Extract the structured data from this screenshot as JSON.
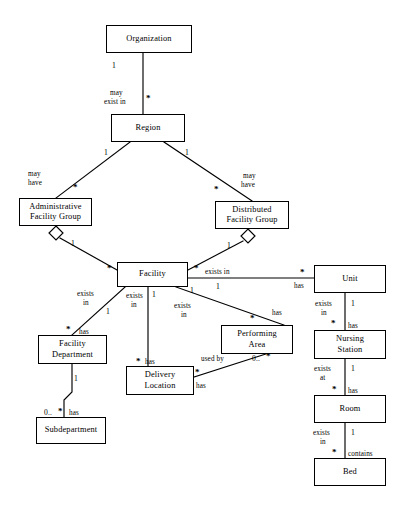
{
  "diagram": {
    "type": "uml-class-diagram",
    "background_color": "#ffffff",
    "line_color": "#000000"
  },
  "entities": [
    {
      "id": "organization",
      "name": "Organization",
      "lines": [
        "Organization"
      ],
      "x": 106,
      "y": 25,
      "w": 86,
      "h": 28
    },
    {
      "id": "region",
      "name": "Region",
      "lines": [
        "Region"
      ],
      "x": 111,
      "y": 114,
      "w": 74,
      "h": 28
    },
    {
      "id": "administrative_group",
      "name": "Administrative Facility Group",
      "lines": [
        "Administrative",
        "Facility Group"
      ],
      "x": 19,
      "y": 198,
      "w": 73,
      "h": 28
    },
    {
      "id": "distributed_group",
      "name": "Distributed Facility Group",
      "lines": [
        "Distributed",
        "Facility Group"
      ],
      "x": 215,
      "y": 201,
      "w": 74,
      "h": 28
    },
    {
      "id": "facility",
      "name": "Facility",
      "lines": [
        "Facility"
      ],
      "x": 117,
      "y": 262,
      "w": 71,
      "h": 25
    },
    {
      "id": "unit",
      "name": "Unit",
      "lines": [
        "Unit"
      ],
      "x": 314,
      "y": 265,
      "w": 72,
      "h": 28
    },
    {
      "id": "nursing_station",
      "name": "Nursing Station",
      "lines": [
        "Nursing",
        "Station"
      ],
      "x": 314,
      "y": 330,
      "w": 72,
      "h": 29
    },
    {
      "id": "room",
      "name": "Room",
      "lines": [
        "Room"
      ],
      "x": 314,
      "y": 395,
      "w": 72,
      "h": 28
    },
    {
      "id": "bed",
      "name": "Bed",
      "lines": [
        "Bed"
      ],
      "x": 314,
      "y": 458,
      "w": 72,
      "h": 28
    },
    {
      "id": "facility_department",
      "name": "Facility Department",
      "lines": [
        "Facility",
        "Department"
      ],
      "x": 38,
      "y": 335,
      "w": 69,
      "h": 29
    },
    {
      "id": "subdepartment",
      "name": "Subdepartment",
      "lines": [
        "Subdepartment"
      ],
      "x": 36,
      "y": 417,
      "w": 70,
      "h": 27
    },
    {
      "id": "delivery_location",
      "name": "Delivery Location",
      "lines": [
        "Delivery",
        "Location"
      ],
      "x": 126,
      "y": 366,
      "w": 68,
      "h": 29
    },
    {
      "id": "performing_area",
      "name": "Performing Area",
      "lines": [
        "Performing",
        "Area"
      ],
      "x": 221,
      "y": 325,
      "w": 72,
      "h": 29
    }
  ],
  "relationships": [
    {
      "id": "org-region",
      "from": "organization",
      "to": "region",
      "from_mult": "1",
      "to_mult": "*",
      "label": "may\nexist in",
      "kind": "association"
    },
    {
      "id": "region-admin",
      "from": "region",
      "to": "administrative_group",
      "from_mult": "1",
      "to_mult": "*",
      "label": "may\nhave",
      "kind": "association"
    },
    {
      "id": "region-distributed",
      "from": "region",
      "to": "distributed_group",
      "from_mult": "1",
      "to_mult": "*",
      "label": "may\nhave",
      "kind": "association"
    },
    {
      "id": "admin-facility",
      "from": "administrative_group",
      "to": "facility",
      "from_mult": "1",
      "to_mult": "*",
      "label": "",
      "kind": "aggregation"
    },
    {
      "id": "distributed-facility",
      "from": "distributed_group",
      "to": "facility",
      "from_mult": "1",
      "to_mult": "*",
      "label": "",
      "kind": "aggregation"
    },
    {
      "id": "facility-unit",
      "from": "facility",
      "to": "unit",
      "from_mult": "1",
      "to_mult": "*",
      "label": "exists in",
      "label2": "has",
      "kind": "association"
    },
    {
      "id": "facility-department",
      "from": "facility",
      "to": "facility_department",
      "from_mult": "1",
      "to_mult": "*",
      "label": "exists\nin",
      "label2": "has",
      "kind": "association"
    },
    {
      "id": "facility-delivery",
      "from": "facility",
      "to": "delivery_location",
      "from_mult": "1",
      "to_mult": "*",
      "label": "exists\nin",
      "label2": "has",
      "kind": "association"
    },
    {
      "id": "facility-performing",
      "from": "facility",
      "to": "performing_area",
      "from_mult": "1",
      "to_mult": "*",
      "label": "exists\nin",
      "label2": "has",
      "kind": "association"
    },
    {
      "id": "unit-nursing",
      "from": "unit",
      "to": "nursing_station",
      "from_mult": "1",
      "to_mult": "*",
      "label": "exists\nin",
      "label2": "has",
      "kind": "association"
    },
    {
      "id": "nursing-room",
      "from": "nursing_station",
      "to": "room",
      "from_mult": "1",
      "to_mult": "*",
      "label": "exists\nat",
      "label2": "has",
      "kind": "association"
    },
    {
      "id": "room-bed",
      "from": "room",
      "to": "bed",
      "from_mult": "1",
      "to_mult": "*",
      "label": "exists\nin",
      "label2": "contains",
      "kind": "association"
    },
    {
      "id": "department-sub",
      "from": "facility_department",
      "to": "subdepartment",
      "from_mult": "1",
      "to_mult": "0..*",
      "label": "",
      "label2": "has",
      "kind": "association"
    },
    {
      "id": "delivery-performing",
      "from": "delivery_location",
      "to": "performing_area",
      "from_mult": "*",
      "to_mult": "0..*",
      "label": "used by",
      "label2": "has",
      "kind": "association"
    }
  ],
  "edge_labels": [
    {
      "id": "lbl-org-region-mult1",
      "text": "1",
      "x": 112,
      "y": 62,
      "role": "multiplicity"
    },
    {
      "id": "lbl-org-region",
      "text": "may",
      "x": 110,
      "y": 89,
      "role": "role-name"
    },
    {
      "id": "lbl-org-region-b",
      "text": "exist in",
      "x": 104,
      "y": 98,
      "role": "role-name"
    },
    {
      "id": "lbl-region-star",
      "text": "*",
      "x": 146,
      "y": 94,
      "role": "multiplicity"
    },
    {
      "id": "lbl-region-admin-1",
      "text": "1",
      "x": 104,
      "y": 149,
      "role": "multiplicity"
    },
    {
      "id": "lbl-region-dist-1",
      "text": "1",
      "x": 185,
      "y": 149,
      "role": "multiplicity"
    },
    {
      "id": "lbl-may-have-left-a",
      "text": "may",
      "x": 28,
      "y": 170,
      "role": "role-name"
    },
    {
      "id": "lbl-may-have-left-b",
      "text": "have",
      "x": 28,
      "y": 179,
      "role": "role-name"
    },
    {
      "id": "lbl-admin-star",
      "text": "*",
      "x": 73,
      "y": 183,
      "role": "multiplicity"
    },
    {
      "id": "lbl-may-have-right-a",
      "text": "may",
      "x": 243,
      "y": 172,
      "role": "role-name"
    },
    {
      "id": "lbl-may-have-right-b",
      "text": "have",
      "x": 241,
      "y": 181,
      "role": "role-name"
    },
    {
      "id": "lbl-dist-star",
      "text": "*",
      "x": 214,
      "y": 185,
      "role": "multiplicity"
    },
    {
      "id": "lbl-admin-diamond-1",
      "text": "1",
      "x": 71,
      "y": 240,
      "role": "multiplicity"
    },
    {
      "id": "lbl-dist-diamond-1",
      "text": "1",
      "x": 227,
      "y": 242,
      "role": "multiplicity"
    },
    {
      "id": "lbl-fac-left-star",
      "text": "*",
      "x": 107,
      "y": 264,
      "role": "multiplicity"
    },
    {
      "id": "lbl-fac-right-star",
      "text": "*",
      "x": 194,
      "y": 264,
      "role": "multiplicity"
    },
    {
      "id": "lbl-fac-unit",
      "text": "exists in",
      "x": 205,
      "y": 268,
      "role": "role-name"
    },
    {
      "id": "lbl-fac-unit-1",
      "text": "1",
      "x": 216,
      "y": 283,
      "role": "multiplicity"
    },
    {
      "id": "lbl-unit-star",
      "text": "*",
      "x": 300,
      "y": 268,
      "role": "multiplicity"
    },
    {
      "id": "lbl-unit-has",
      "text": "has",
      "x": 294,
      "y": 282,
      "role": "role-name"
    },
    {
      "id": "lbl-fac-dept-a",
      "text": "exists",
      "x": 77,
      "y": 290,
      "role": "role-name"
    },
    {
      "id": "lbl-fac-dept-b",
      "text": "in",
      "x": 83,
      "y": 299,
      "role": "role-name"
    },
    {
      "id": "lbl-fac-dept-1",
      "text": "1",
      "x": 106,
      "y": 308,
      "role": "multiplicity"
    },
    {
      "id": "lbl-dept-star",
      "text": "*",
      "x": 66,
      "y": 326,
      "role": "multiplicity"
    },
    {
      "id": "lbl-dept-has",
      "text": "has",
      "x": 79,
      "y": 328,
      "role": "role-name"
    },
    {
      "id": "lbl-fac-del-a",
      "text": "exists",
      "x": 126,
      "y": 292,
      "role": "role-name"
    },
    {
      "id": "lbl-fac-del-b",
      "text": "in",
      "x": 131,
      "y": 301,
      "role": "role-name"
    },
    {
      "id": "lbl-fac-del-1",
      "text": "1",
      "x": 152,
      "y": 291,
      "role": "multiplicity"
    },
    {
      "id": "lbl-del-star",
      "text": "*",
      "x": 137,
      "y": 359,
      "role": "multiplicity"
    },
    {
      "id": "lbl-del-has",
      "text": "has",
      "x": 145,
      "y": 358,
      "role": "role-name"
    },
    {
      "id": "lbl-fac-perf-a",
      "text": "exists",
      "x": 174,
      "y": 302,
      "role": "role-name"
    },
    {
      "id": "lbl-fac-perf-b",
      "text": "in",
      "x": 181,
      "y": 311,
      "role": "role-name"
    },
    {
      "id": "lbl-fac-perf-1",
      "text": "1",
      "x": 190,
      "y": 287,
      "role": "multiplicity"
    },
    {
      "id": "lbl-perf-star",
      "text": "*",
      "x": 250,
      "y": 315,
      "role": "multiplicity"
    },
    {
      "id": "lbl-perf-has",
      "text": "has",
      "x": 272,
      "y": 309,
      "role": "role-name"
    },
    {
      "id": "lbl-unit-ns-a",
      "text": "exists",
      "x": 315,
      "y": 300,
      "role": "role-name"
    },
    {
      "id": "lbl-unit-ns-b",
      "text": "in",
      "x": 321,
      "y": 309,
      "role": "role-name"
    },
    {
      "id": "lbl-unit-ns-1",
      "text": "1",
      "x": 351,
      "y": 300,
      "role": "multiplicity"
    },
    {
      "id": "lbl-ns-star",
      "text": "*",
      "x": 332,
      "y": 320,
      "role": "multiplicity"
    },
    {
      "id": "lbl-ns-has",
      "text": "has",
      "x": 348,
      "y": 322,
      "role": "role-name"
    },
    {
      "id": "lbl-ns-room-a",
      "text": "exists",
      "x": 314,
      "y": 365,
      "role": "role-name"
    },
    {
      "id": "lbl-ns-room-b",
      "text": "at",
      "x": 320,
      "y": 374,
      "role": "role-name"
    },
    {
      "id": "lbl-ns-room-1",
      "text": "1",
      "x": 351,
      "y": 365,
      "role": "multiplicity"
    },
    {
      "id": "lbl-room-star",
      "text": "*",
      "x": 333,
      "y": 386,
      "role": "multiplicity"
    },
    {
      "id": "lbl-room-has",
      "text": "has",
      "x": 348,
      "y": 387,
      "role": "role-name"
    },
    {
      "id": "lbl-room-bed-a",
      "text": "exists",
      "x": 313,
      "y": 429,
      "role": "role-name"
    },
    {
      "id": "lbl-room-bed-b",
      "text": "in",
      "x": 320,
      "y": 438,
      "role": "role-name"
    },
    {
      "id": "lbl-room-bed-1",
      "text": "1",
      "x": 351,
      "y": 429,
      "role": "multiplicity"
    },
    {
      "id": "lbl-bed-star",
      "text": "*",
      "x": 333,
      "y": 449,
      "role": "multiplicity"
    },
    {
      "id": "lbl-bed-contains",
      "text": "contains",
      "x": 348,
      "y": 450,
      "role": "role-name"
    },
    {
      "id": "lbl-dept-sub-1",
      "text": "1",
      "x": 74,
      "y": 375,
      "role": "multiplicity"
    },
    {
      "id": "lbl-sub-mult",
      "text": "0..",
      "x": 44,
      "y": 409,
      "role": "multiplicity"
    },
    {
      "id": "lbl-sub-star",
      "text": "*",
      "x": 59,
      "y": 408,
      "role": "multiplicity"
    },
    {
      "id": "lbl-sub-has",
      "text": "has",
      "x": 69,
      "y": 409,
      "role": "role-name"
    },
    {
      "id": "lbl-usedby",
      "text": "used by",
      "x": 201,
      "y": 355,
      "role": "role-name"
    },
    {
      "id": "lbl-perf-0star-a",
      "text": "0..",
      "x": 252,
      "y": 355,
      "role": "multiplicity"
    },
    {
      "id": "lbl-perf-0star-b",
      "text": "*",
      "x": 267,
      "y": 354,
      "role": "multiplicity"
    },
    {
      "id": "lbl-del-perf-star",
      "text": "*",
      "x": 196,
      "y": 370,
      "role": "multiplicity"
    },
    {
      "id": "lbl-del-perf-has",
      "text": "has",
      "x": 196,
      "y": 382,
      "role": "role-name"
    }
  ]
}
